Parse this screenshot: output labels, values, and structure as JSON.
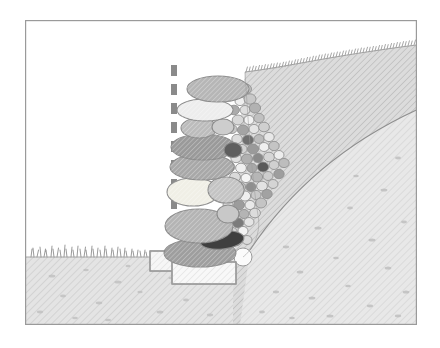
{
  "figure": {
    "title": "Dry stone retaining wall cross-section",
    "background_color": "#ffffff",
    "frame": {
      "label": "illustration-border",
      "x": 25,
      "y": 20,
      "width": 392,
      "height": 305,
      "stroke": "#9a9a9a",
      "stroke_width": 1.2,
      "fill": "#ffffff"
    },
    "sky": {
      "label": "sky-void",
      "fill": "#ffffff"
    },
    "ground_left": {
      "label": "foreground-ground-plane",
      "fill": "#e3e3e3",
      "hatch_color": "#cfcfcf",
      "speckle_color": "#b9b9b9",
      "surface_y": 257
    },
    "slope_right": {
      "label": "embankment-slope",
      "fill": "#dcdcdc",
      "hatch_color": "#c6c6c6",
      "crest_right_y": 45,
      "toe_left_y": 72
    },
    "subsoil": {
      "label": "subsoil-layer",
      "fill": "#e6e6e6",
      "boundary_stroke": "#8e8e8e",
      "speckle_color": "#bcbcbc"
    },
    "grass_foreground": {
      "label": "grass-tufts-foreground",
      "stroke": "#9d9d9d",
      "baseline_y": 257,
      "x_start": 30,
      "x_end": 150,
      "tuft_count": 26
    },
    "grass_slope": {
      "label": "grass-tufts-slope-crest",
      "stroke": "#a6a6a6",
      "tuft_count": 70
    },
    "plumb_line": {
      "label": "vertical-plumb-reference-line",
      "x": 174,
      "y_top": 65,
      "y_bottom": 232,
      "color": "#8a8a8a",
      "dash_length": 11,
      "gap_length": 8,
      "width": 6
    },
    "foundation": {
      "label": "foundation-blocks",
      "stroke": "#9a9a9a",
      "fill": "#f4f4f4",
      "hatch_color": "#dddddd",
      "blocks": [
        {
          "name": "upper-foundation-block",
          "x": 150,
          "y": 251,
          "width": 36,
          "height": 20
        },
        {
          "name": "lower-foundation-block",
          "x": 172,
          "y": 262,
          "width": 64,
          "height": 22
        }
      ]
    },
    "face_stones": {
      "label": "wall-face-stone-course",
      "stroke": "#8c8c8c",
      "count": 14,
      "palette": [
        "#b6b6b6",
        "#ededed",
        "#c4c4c4",
        "#9e9e9e",
        "#a8a8a8",
        "#f0efe8",
        "#cccccc",
        "#8f8f8f",
        "#3f3f3f"
      ]
    },
    "gravel_backfill": {
      "label": "drainage-gravel-backfill",
      "stroke": "#8f8f8f",
      "count": 96,
      "palette": [
        "#d8d8d8",
        "#c2c2c2",
        "#ededed",
        "#a9a9a9",
        "#8d8d8d",
        "#6a6a6a",
        "#4a4a4a",
        "#f5f5f5",
        "#b4b4b4"
      ]
    },
    "white_cobble": {
      "label": "white-base-cobble",
      "cx": 243,
      "cy": 257,
      "r": 9,
      "fill": "#fbfbfb",
      "stroke": "#9a9a9a"
    }
  }
}
